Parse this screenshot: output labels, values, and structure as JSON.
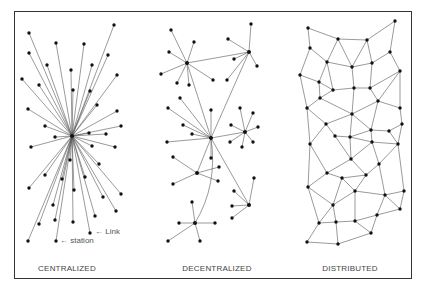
{
  "figure": {
    "panels": [
      {
        "id": "centralized",
        "label": "CENTRALIZED",
        "label_x": 67
      },
      {
        "id": "decentralized",
        "label": "DECENTRALIZED",
        "label_x": 217
      },
      {
        "id": "distributed",
        "label": "DISTRIBUTED",
        "label_x": 350
      }
    ],
    "annotations": {
      "link": "← Link",
      "station": "← station"
    }
  },
  "centralized": {
    "hub": [
      72,
      136
    ],
    "leaves": [
      [
        29,
        33
      ],
      [
        56,
        43
      ],
      [
        114,
        25
      ],
      [
        84,
        44
      ],
      [
        29,
        53
      ],
      [
        108,
        55
      ],
      [
        47,
        65
      ],
      [
        92,
        65
      ],
      [
        71,
        70
      ],
      [
        22,
        79
      ],
      [
        117,
        75
      ],
      [
        39,
        85
      ],
      [
        73,
        90
      ],
      [
        90,
        91
      ],
      [
        97,
        105
      ],
      [
        28,
        109
      ],
      [
        117,
        111
      ],
      [
        45,
        126
      ],
      [
        121,
        126
      ],
      [
        106,
        134
      ],
      [
        89,
        133
      ],
      [
        55,
        137
      ],
      [
        31,
        147
      ],
      [
        92,
        146
      ],
      [
        115,
        147
      ],
      [
        70,
        160
      ],
      [
        99,
        164
      ],
      [
        45,
        175
      ],
      [
        85,
        177
      ],
      [
        62,
        179
      ],
      [
        29,
        188
      ],
      [
        74,
        190
      ],
      [
        121,
        194
      ],
      [
        103,
        197
      ],
      [
        53,
        205
      ],
      [
        116,
        211
      ],
      [
        95,
        216
      ],
      [
        55,
        220
      ],
      [
        39,
        224
      ],
      [
        73,
        222
      ],
      [
        90,
        233
      ],
      [
        28,
        241
      ],
      [
        56,
        241
      ]
    ]
  },
  "decentralized": {
    "hubs": [
      {
        "c": [
          187,
          63
        ],
        "leaves": [
          [
            171,
            30
          ],
          [
            194,
            42
          ],
          [
            169,
            52
          ],
          [
            161,
            74
          ],
          [
            177,
            83
          ],
          [
            189,
            85
          ],
          [
            213,
            80
          ]
        ]
      },
      {
        "c": [
          249,
          52
        ],
        "leaves": [
          [
            251,
            24
          ],
          [
            228,
            39
          ],
          [
            234,
            59
          ],
          [
            257,
            66
          ],
          [
            227,
            80
          ]
        ]
      },
      {
        "c": [
          211,
          138
        ],
        "leaves": [
          [
            180,
            98
          ],
          [
            168,
            108
          ],
          [
            211,
            110
          ],
          [
            183,
            125
          ],
          [
            192,
            134
          ],
          [
            167,
            142
          ],
          [
            211,
            158
          ]
        ]
      },
      {
        "c": [
          245,
          132
        ],
        "leaves": [
          [
            240,
            108
          ],
          [
            253,
            113
          ],
          [
            231,
            125
          ],
          [
            258,
            127
          ],
          [
            230,
            142
          ],
          [
            242,
            147
          ],
          [
            253,
            142
          ]
        ]
      },
      {
        "c": [
          197,
          173
        ],
        "leaves": [
          [
            173,
            157
          ],
          [
            219,
            167
          ],
          [
            218,
            181
          ],
          [
            173,
            184
          ]
        ]
      },
      {
        "c": [
          249,
          205
        ],
        "leaves": [
          [
            254,
            178
          ],
          [
            234,
            191
          ],
          [
            232,
            206
          ],
          [
            232,
            218
          ]
        ]
      },
      {
        "c": [
          195,
          223
        ],
        "leaves": [
          [
            192,
            202
          ],
          [
            179,
            223
          ],
          [
            215,
            223
          ],
          [
            168,
            241
          ],
          [
            200,
            241
          ]
        ]
      }
    ],
    "hub_links": [
      [
        187,
        63,
        249,
        52
      ],
      [
        187,
        63,
        211,
        138
      ],
      [
        249,
        52,
        211,
        138
      ],
      [
        211,
        138,
        245,
        132
      ],
      [
        211,
        138,
        197,
        173
      ],
      [
        211,
        138,
        249,
        205
      ]
    ],
    "curve": "M211,138 Q218,185 195,223"
  },
  "distributed": {
    "nodes": [
      [
        308,
        28
      ],
      [
        338,
        39
      ],
      [
        367,
        40
      ],
      [
        395,
        21
      ],
      [
        310,
        48
      ],
      [
        390,
        52
      ],
      [
        327,
        62
      ],
      [
        352,
        67
      ],
      [
        372,
        63
      ],
      [
        400,
        71
      ],
      [
        300,
        75
      ],
      [
        319,
        82
      ],
      [
        333,
        90
      ],
      [
        354,
        88
      ],
      [
        370,
        88
      ],
      [
        320,
        98
      ],
      [
        378,
        101
      ],
      [
        307,
        108
      ],
      [
        400,
        108
      ],
      [
        352,
        114
      ],
      [
        326,
        124
      ],
      [
        402,
        124
      ],
      [
        371,
        130
      ],
      [
        389,
        131
      ],
      [
        335,
        136
      ],
      [
        350,
        137
      ],
      [
        310,
        144
      ],
      [
        372,
        142
      ],
      [
        398,
        144
      ],
      [
        351,
        159
      ],
      [
        379,
        164
      ],
      [
        327,
        173
      ],
      [
        342,
        178
      ],
      [
        366,
        175
      ],
      [
        308,
        187
      ],
      [
        355,
        191
      ],
      [
        385,
        195
      ],
      [
        404,
        191
      ],
      [
        333,
        205
      ],
      [
        400,
        209
      ],
      [
        377,
        215
      ],
      [
        319,
        223
      ],
      [
        336,
        222
      ],
      [
        355,
        221
      ],
      [
        371,
        233
      ],
      [
        307,
        242
      ],
      [
        338,
        244
      ]
    ],
    "edges": [
      [
        0,
        1
      ],
      [
        1,
        2
      ],
      [
        2,
        3
      ],
      [
        0,
        4
      ],
      [
        3,
        5
      ],
      [
        1,
        6
      ],
      [
        1,
        7
      ],
      [
        2,
        7
      ],
      [
        2,
        8
      ],
      [
        5,
        8
      ],
      [
        5,
        9
      ],
      [
        4,
        6
      ],
      [
        4,
        10
      ],
      [
        6,
        7
      ],
      [
        7,
        8
      ],
      [
        6,
        11
      ],
      [
        10,
        11
      ],
      [
        11,
        12
      ],
      [
        6,
        12
      ],
      [
        12,
        13
      ],
      [
        7,
        13
      ],
      [
        13,
        14
      ],
      [
        8,
        14
      ],
      [
        9,
        14
      ],
      [
        9,
        16
      ],
      [
        11,
        15
      ],
      [
        12,
        15
      ],
      [
        10,
        17
      ],
      [
        15,
        17
      ],
      [
        14,
        16
      ],
      [
        16,
        18
      ],
      [
        9,
        18
      ],
      [
        13,
        19
      ],
      [
        15,
        19
      ],
      [
        16,
        19
      ],
      [
        17,
        20
      ],
      [
        19,
        20
      ],
      [
        16,
        22
      ],
      [
        18,
        21
      ],
      [
        19,
        22
      ],
      [
        22,
        23
      ],
      [
        21,
        23
      ],
      [
        20,
        24
      ],
      [
        24,
        25
      ],
      [
        19,
        25
      ],
      [
        22,
        25
      ],
      [
        17,
        26
      ],
      [
        20,
        26
      ],
      [
        22,
        27
      ],
      [
        25,
        27
      ],
      [
        23,
        28
      ],
      [
        27,
        28
      ],
      [
        21,
        28
      ],
      [
        26,
        31
      ],
      [
        24,
        29
      ],
      [
        25,
        29
      ],
      [
        27,
        29
      ],
      [
        27,
        30
      ],
      [
        28,
        30
      ],
      [
        29,
        31
      ],
      [
        29,
        33
      ],
      [
        30,
        33
      ],
      [
        31,
        32
      ],
      [
        32,
        33
      ],
      [
        26,
        34
      ],
      [
        31,
        34
      ],
      [
        32,
        35
      ],
      [
        33,
        35
      ],
      [
        30,
        36
      ],
      [
        35,
        36
      ],
      [
        36,
        37
      ],
      [
        28,
        37
      ],
      [
        34,
        38
      ],
      [
        32,
        38
      ],
      [
        35,
        38
      ],
      [
        36,
        39
      ],
      [
        37,
        39
      ],
      [
        39,
        40
      ],
      [
        36,
        40
      ],
      [
        34,
        41
      ],
      [
        38,
        41
      ],
      [
        38,
        42
      ],
      [
        41,
        42
      ],
      [
        35,
        43
      ],
      [
        42,
        43
      ],
      [
        43,
        40
      ],
      [
        40,
        44
      ],
      [
        43,
        44
      ],
      [
        41,
        45
      ],
      [
        45,
        46
      ],
      [
        42,
        46
      ],
      [
        46,
        44
      ]
    ]
  }
}
